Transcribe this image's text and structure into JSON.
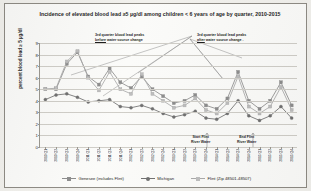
{
  "chart_data": {
    "type": "line",
    "title": "Incidence of elevated blood lead ≥5 µg/dl among children < 6 years of age by quarter, 2010-2015",
    "xlabel": "",
    "ylabel": "percent blood lead ≥ 5 µg/dl",
    "ylim": [
      0,
      9
    ],
    "yticks": [
      0,
      1,
      2,
      3,
      4,
      5,
      6,
      7,
      8,
      9
    ],
    "grid": true,
    "legend_position": "bottom",
    "categories": [
      "2010 Q1",
      "2010 Q2",
      "2010 Q3",
      "2010 Q4",
      "2011 Q1",
      "2011 Q2",
      "2011 Q3",
      "2011 Q4",
      "2012 Q1",
      "2012 Q2",
      "2012 Q3",
      "2012 Q4",
      "2013 Q1",
      "2013 Q2",
      "2013 Q3",
      "2013 Q4",
      "2014 Q1",
      "2014 Q2",
      "2014 Q3",
      "2014 Q4",
      "2015 Q1",
      "2015 Q2",
      "2015 Q3",
      "2015 Q4"
    ],
    "series": [
      {
        "name": "Genesee (includes Flint)",
        "color": "#8c8c8c",
        "values": [
          5.0,
          5.0,
          7.2,
          8.2,
          6.1,
          5.4,
          6.8,
          5.6,
          5.1,
          6.1,
          5.0,
          4.4,
          3.8,
          4.0,
          4.5,
          3.6,
          3.3,
          4.2,
          6.5,
          4.0,
          3.3,
          4.0,
          5.6,
          3.6
        ]
      },
      {
        "name": "Michigan",
        "color": "#6f6f6f",
        "values": [
          4.1,
          4.5,
          4.6,
          4.3,
          3.9,
          4.0,
          4.1,
          3.5,
          3.4,
          3.6,
          3.3,
          2.9,
          2.6,
          2.8,
          3.1,
          2.5,
          2.4,
          2.9,
          4.0,
          2.7,
          2.3,
          2.7,
          3.5,
          2.5
        ]
      },
      {
        "name": "Flint (Zip 48501-48507)",
        "color": "#a9a9a9",
        "values": [
          5.0,
          5.1,
          7.4,
          8.3,
          6.0,
          4.9,
          6.5,
          5.0,
          4.6,
          6.3,
          4.6,
          4.0,
          3.4,
          3.6,
          4.2,
          3.2,
          2.9,
          3.8,
          6.1,
          3.5,
          2.9,
          3.5,
          5.2,
          3.2
        ]
      }
    ],
    "annotations": [
      {
        "id": "pre-change-note",
        "line1": "3rd quarter  blood lead peaks",
        "line2_underlined": "before",
        "line2_rest": " water source change"
      },
      {
        "id": "post-change-note",
        "line1": "3rd quarter blood lead peaks",
        "line2_underlined": "after",
        "line2_rest": " water source change ."
      },
      {
        "id": "start-flint-river-water",
        "line1": "Start  Flint",
        "line2": "River Water"
      },
      {
        "id": "end-flint-river-water",
        "line1": "End Flint",
        "line2": "River Water"
      }
    ]
  }
}
